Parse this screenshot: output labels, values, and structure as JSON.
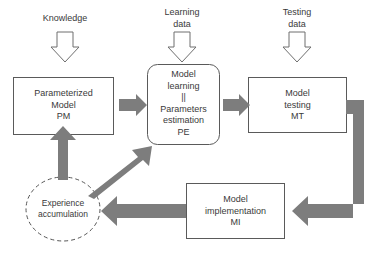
{
  "diagram": {
    "colors": {
      "box_stroke": "#5a5a5a",
      "text": "#3a3a3a",
      "arrow_fill": "#7d7d7d",
      "arrow_outline_stroke": "#6e6e6e",
      "background": "#ffffff",
      "dashed_stroke": "#555555"
    },
    "inputs": [
      {
        "id": "knowledge",
        "label": "Knowledge",
        "icon": "down-outline-arrow-icon"
      },
      {
        "id": "learning-data",
        "label": "Learning\ndata",
        "icon": "down-outline-arrow-icon"
      },
      {
        "id": "testing-data",
        "label": "Testing\ndata",
        "icon": "down-outline-arrow-icon"
      }
    ],
    "nodes": [
      {
        "id": "pm",
        "shape": "rect",
        "label": "Parameterized\nModel\nPM"
      },
      {
        "id": "pe",
        "shape": "rounded-rect",
        "label": "Model\nlearning\n||\nParameters\nestimation\nPE"
      },
      {
        "id": "mt",
        "shape": "rect",
        "label": "Model\ntesting\nMT"
      },
      {
        "id": "mi",
        "shape": "rect",
        "label": "Model\nimplementation\nMI"
      },
      {
        "id": "experience",
        "shape": "dashed-ellipse",
        "label": "Experience\naccumulation"
      }
    ],
    "edges": [
      {
        "id": "pm-to-pe",
        "from": "pm",
        "to": "pe",
        "style": "block-arrow-right"
      },
      {
        "id": "pe-to-mt",
        "from": "pe",
        "to": "mt",
        "style": "block-arrow-right"
      },
      {
        "id": "mt-to-mi",
        "from": "mt",
        "to": "mi",
        "style": "elbow-arrow-left"
      },
      {
        "id": "mi-to-experience",
        "from": "mi",
        "to": "experience",
        "style": "block-arrow-left"
      },
      {
        "id": "experience-to-pm",
        "from": "experience",
        "to": "pm",
        "style": "block-arrow-up"
      },
      {
        "id": "experience-to-pe",
        "from": "experience",
        "to": "pe",
        "style": "block-arrow-diagonal-up-right"
      }
    ]
  }
}
